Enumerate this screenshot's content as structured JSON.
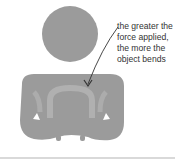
{
  "figure": {
    "annotation": {
      "lines": [
        "the greater the",
        "force applied,",
        "the more the",
        "object bends"
      ]
    },
    "colors": {
      "object": "#9b9b9b",
      "highlight": "#b0b0b0",
      "text": "#333333",
      "arrow": "#333333",
      "rule": "#d9d9d9"
    }
  }
}
